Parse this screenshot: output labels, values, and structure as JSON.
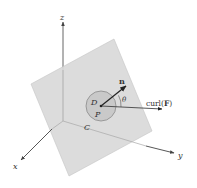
{
  "diagram": {
    "type": "3d-surface-curl-illustration",
    "colors": {
      "background": "#ffffff",
      "plane_fill": "#d9d9d9",
      "plane_edge": "#c4c4c4",
      "disc_fill": "#c9c9c9",
      "disc_edge": "#8a8a8a",
      "axis": "#555555",
      "vector": "#222222",
      "text": "#333333"
    },
    "origin": [
      63,
      121
    ],
    "axes": [
      {
        "name": "z",
        "label": "z",
        "tip": [
          63,
          22
        ],
        "label_pos": [
          62,
          17
        ]
      },
      {
        "name": "x",
        "label": "x",
        "tip": [
          21,
          160
        ],
        "label_pos": [
          15,
          169
        ]
      },
      {
        "name": "y",
        "label": "y",
        "tip": [
          174,
          153
        ],
        "label_pos": [
          180,
          158
        ]
      }
    ],
    "plane": {
      "corners": [
        [
          114,
          39
        ],
        [
          152,
          131
        ],
        [
          69,
          176
        ],
        [
          31,
          84
        ]
      ]
    },
    "disc": {
      "center": [
        101,
        106
      ],
      "radius": 15,
      "region_label": "D",
      "region_label_pos": [
        95,
        103
      ],
      "point_label": "P",
      "point_label_pos": [
        97,
        117
      ],
      "curve_label": "C",
      "curve_label_pos": [
        86,
        130
      ]
    },
    "vectors": [
      {
        "name": "normal",
        "label": "n",
        "to": [
          126,
          86
        ],
        "label_pos": [
          121,
          82
        ]
      },
      {
        "name": "curl",
        "label": "curl(F)",
        "label_prefix": "curl(",
        "label_bold": "F",
        "label_suffix": ")",
        "to": [
          162,
          109
        ],
        "label_pos": [
          147,
          104
        ]
      }
    ],
    "angle": {
      "label": "θ",
      "label_pos": [
        124,
        100
      ]
    }
  }
}
